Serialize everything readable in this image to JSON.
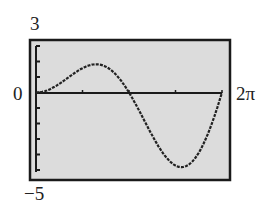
{
  "labels": {
    "ymax": "3",
    "zero": "0",
    "xmax": "2π",
    "ymin": "−5"
  },
  "colors": {
    "screen_bg": "#dcdcdc",
    "frame": "#1a1a1a",
    "curve": "#222222"
  },
  "chart_data": {
    "type": "line",
    "title": "",
    "xlabel": "",
    "ylabel": "",
    "xlim": [
      0,
      6.2832
    ],
    "ylim": [
      -5,
      3
    ],
    "x_tick_labels": [
      "0",
      "2π"
    ],
    "y_tick_labels": [
      "3",
      "0",
      "−5"
    ],
    "grid": false,
    "legend": null,
    "annotations": [
      "calculator-style graph window [0, 2π] × [−5, 3]"
    ],
    "series": [
      {
        "name": "y = x·sin(x)",
        "x": [
          0,
          0.39,
          0.79,
          1.18,
          1.57,
          1.96,
          2.36,
          2.75,
          3.14,
          3.53,
          3.93,
          4.32,
          4.71,
          5.11,
          5.5,
          5.89,
          6.28
        ],
        "y": [
          0,
          0.15,
          0.56,
          1.09,
          1.57,
          1.81,
          1.67,
          1.05,
          0,
          -1.35,
          -2.78,
          -3.99,
          -4.71,
          -4.72,
          -3.89,
          -2.25,
          0
        ]
      }
    ]
  }
}
